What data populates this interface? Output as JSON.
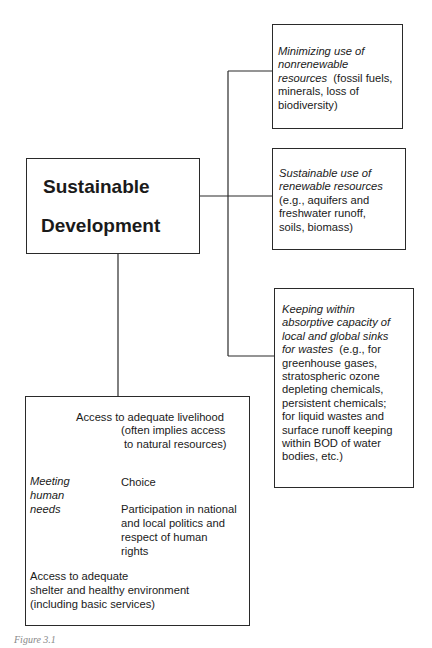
{
  "central": {
    "line1": "Sustainable",
    "line2": "Development"
  },
  "right_boxes": [
    {
      "italic": [
        "Minimizing  use of",
        "nonrenewable",
        "resources"
      ],
      "normal_after_italic": "  (fossil fuels,",
      "rest": [
        "minerals, loss of",
        "biodiversity)"
      ]
    },
    {
      "italic": [
        "Sustainable use of",
        "renewable resources"
      ],
      "rest": [
        "(e.g., aquifers and",
        "freshwater runoff,",
        "soils, biomass)"
      ]
    },
    {
      "italic": [
        "Keeping within",
        "absorptive capacity of",
        "local and global sinks",
        "for wastes"
      ],
      "normal_after_italic": "  (e.g., for",
      "rest": [
        "greenhouse gases,",
        "stratospheric ozone",
        "depleting chemicals,",
        "persistent chemicals;",
        "for liquid wastes and",
        "surface runoff keeping",
        "within BOD of water",
        "bodies, etc.)"
      ]
    }
  ],
  "needs_box": {
    "center_label": [
      "Meeting",
      "human",
      "needs"
    ],
    "livelihood": [
      "Access to adequate livelihood",
      "(often implies access",
      "to natural resources)"
    ],
    "choice": "Choice",
    "participation": [
      "Participation in national",
      "and local politics and",
      "respect of human",
      "rights"
    ],
    "shelter": [
      "Access to adequate",
      "shelter and healthy environment",
      "(including basic services)"
    ]
  },
  "caption": "Figure 3.1"
}
